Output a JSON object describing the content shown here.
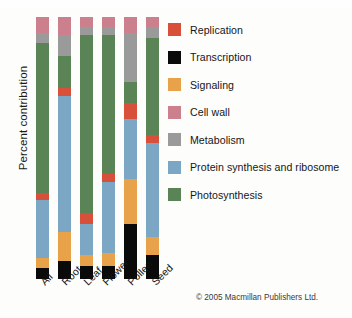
{
  "chart": {
    "type": "bar",
    "ylabel": "Percent contribution",
    "copyright": "© 2005 Macmillan Publishers Ltd."
  },
  "chart_data": {
    "type": "bar",
    "subtype": "stacked-percent",
    "title": "",
    "xlabel": "",
    "ylabel": "Percent contribution",
    "ylim": [
      0,
      100
    ],
    "grid": false,
    "legend_position": "right",
    "categories": [
      "All",
      "Root",
      "Leaf",
      "Flower",
      "Pollen",
      "Seed"
    ],
    "series": [
      {
        "name": "Transcription",
        "color": "#0a0a0a",
        "values": [
          4,
          7,
          5,
          5,
          21,
          9
        ]
      },
      {
        "name": "Signaling",
        "color": "#e8a24a",
        "values": [
          4,
          11,
          4,
          5,
          17,
          7
        ]
      },
      {
        "name": "Protein synthesis and ribosome",
        "color": "#7ba7c4",
        "values": [
          22,
          52,
          12,
          27,
          23,
          36
        ]
      },
      {
        "name": "Replication",
        "color": "#d8503a",
        "values": [
          3,
          3,
          4,
          3,
          6,
          3
        ]
      },
      {
        "name": "Photosynthesis",
        "color": "#5a8456",
        "values": [
          57,
          12,
          68,
          53,
          8,
          37
        ]
      },
      {
        "name": "Metabolism",
        "color": "#9a9a9a",
        "values": [
          4,
          8,
          3,
          3,
          19,
          4
        ]
      },
      {
        "name": "Cell wall",
        "color": "#cc7f8c",
        "values": [
          6,
          7,
          4,
          4,
          6,
          4
        ]
      }
    ],
    "stack_order_bottom_to_top": [
      "Transcription",
      "Signaling",
      "Protein synthesis and ribosome",
      "Replication",
      "Photosynthesis",
      "Metabolism",
      "Cell wall"
    ]
  },
  "legend": {
    "items": [
      {
        "label": "Replication",
        "color": "#d8503a"
      },
      {
        "label": "Transcription",
        "color": "#0a0a0a"
      },
      {
        "label": "Signaling",
        "color": "#e8a24a"
      },
      {
        "label": "Cell wall",
        "color": "#cc7f8c"
      },
      {
        "label": "Metabolism",
        "color": "#9a9a9a"
      },
      {
        "label": "Protein synthesis and ribosome",
        "color": "#7ba7c4"
      },
      {
        "label": "Photosynthesis",
        "color": "#5a8456"
      }
    ]
  }
}
